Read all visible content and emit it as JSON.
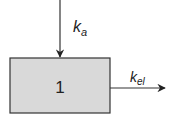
{
  "diagram": {
    "compartment": {
      "label": "1",
      "fill": "#d9d9d9",
      "stroke": "#333333"
    },
    "input_arrow": {
      "label_main": "k",
      "label_sub": "a"
    },
    "output_arrow": {
      "label_main": "k",
      "label_sub": "el"
    }
  }
}
